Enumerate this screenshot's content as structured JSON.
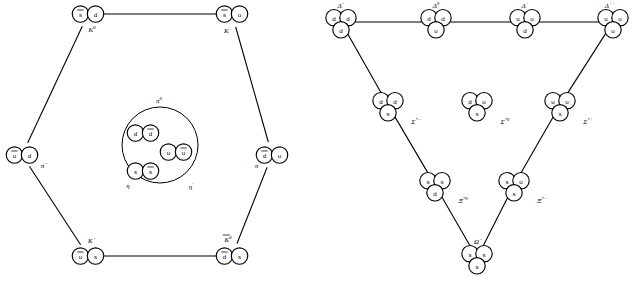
{
  "figure": {
    "title": "",
    "panels": [
      {
        "name": "meson-nonet",
        "shape": "hexagon",
        "nodes": [
          {
            "id": "K0",
            "label": "K",
            "sup": "0",
            "quarks": [
              {
                "f": "s",
                "bar": true
              },
              {
                "f": "d",
                "bar": false
              }
            ],
            "cx": 88,
            "cy": 14,
            "label_x": 92,
            "label_y": 30
          },
          {
            "id": "Kplus",
            "label": "K",
            "sup": "+",
            "quarks": [
              {
                "f": "s",
                "bar": true
              },
              {
                "f": "u",
                "bar": false
              }
            ],
            "cx": 232,
            "cy": 14,
            "label_x": 228,
            "label_y": 31
          },
          {
            "id": "piminus",
            "label": "π",
            "sup": "−",
            "quarks": [
              {
                "f": "u",
                "bar": true
              },
              {
                "f": "d",
                "bar": false
              }
            ],
            "cx": 22,
            "cy": 155,
            "label_x": 44,
            "label_y": 166
          },
          {
            "id": "piplus",
            "label": "π",
            "sup": "+",
            "quarks": [
              {
                "f": "d",
                "bar": true
              },
              {
                "f": "u",
                "bar": false
              }
            ],
            "cx": 272,
            "cy": 155,
            "label_x": 258,
            "label_y": 166
          },
          {
            "id": "Kminus",
            "label": "K",
            "sup": "−",
            "quarks": [
              {
                "f": "u",
                "bar": true
              },
              {
                "f": "s",
                "bar": false
              }
            ],
            "cx": 88,
            "cy": 256,
            "label_x": 92,
            "label_y": 241
          },
          {
            "id": "K0bar",
            "label": "K",
            "sup": "0",
            "bar": true,
            "quarks": [
              {
                "f": "d",
                "bar": true
              },
              {
                "f": "s",
                "bar": false
              }
            ],
            "cx": 232,
            "cy": 256,
            "label_x": 228,
            "label_y": 240
          }
        ],
        "edges": [
          [
            "K0",
            "Kplus"
          ],
          [
            "K0",
            "piminus"
          ],
          [
            "Kplus",
            "piplus"
          ],
          [
            "piminus",
            "Kminus"
          ],
          [
            "piplus",
            "K0bar"
          ],
          [
            "Kminus",
            "K0bar"
          ]
        ],
        "center_circle": {
          "cx": 160,
          "cy": 145,
          "r": 38,
          "labels": [
            {
              "text": "π",
              "sup": "0",
              "x": 159,
              "y": 101
            },
            {
              "text": "η",
              "sup": "",
              "x": 128,
              "y": 186
            },
            {
              "text": "η",
              "sup": "′",
              "x": 191,
              "y": 187
            }
          ],
          "pairs": [
            {
              "quarks": [
                {
                  "f": "d",
                  "bar": false
                },
                {
                  "f": "d",
                  "bar": true
                }
              ],
              "cx": 143,
              "cy": 133
            },
            {
              "quarks": [
                {
                  "f": "u",
                  "bar": false
                },
                {
                  "f": "u",
                  "bar": true
                }
              ],
              "cx": 176,
              "cy": 152
            },
            {
              "quarks": [
                {
                  "f": "s",
                  "bar": false
                },
                {
                  "f": "s",
                  "bar": true
                }
              ],
              "cx": 143,
              "cy": 171
            }
          ]
        }
      },
      {
        "name": "baryon-decuplet",
        "shape": "triangle",
        "nodes": [
          {
            "id": "Dminus",
            "label": "Δ",
            "sup": "−",
            "quarks": [
              {
                "f": "d"
              },
              {
                "f": "d"
              },
              {
                "f": "d"
              }
            ],
            "cx": 341,
            "cy": 22,
            "label_x": 341,
            "label_y": 6
          },
          {
            "id": "D0",
            "label": "Δ",
            "sup": "0",
            "quarks": [
              {
                "f": "d"
              },
              {
                "f": "d"
              },
              {
                "f": "u"
              }
            ],
            "cx": 436,
            "cy": 22,
            "label_x": 436,
            "label_y": 6
          },
          {
            "id": "Dplus",
            "label": "Δ",
            "sup": "+",
            "quarks": [
              {
                "f": "u"
              },
              {
                "f": "u"
              },
              {
                "f": "d"
              }
            ],
            "cx": 525,
            "cy": 22,
            "label_x": 525,
            "label_y": 6
          },
          {
            "id": "Dplusplus",
            "label": "Δ",
            "sup": "++",
            "quarks": [
              {
                "f": "u"
              },
              {
                "f": "u"
              },
              {
                "f": "u"
              }
            ],
            "cx": 613,
            "cy": 22,
            "label_x": 610,
            "label_y": 6
          },
          {
            "id": "Sminus",
            "label": "Σ",
            "sup": "*−",
            "quarks": [
              {
                "f": "d"
              },
              {
                "f": "d"
              },
              {
                "f": "s"
              }
            ],
            "cx": 388,
            "cy": 105,
            "label_x": 416,
            "label_y": 122
          },
          {
            "id": "S0",
            "label": "Σ",
            "sup": "*0",
            "quarks": [
              {
                "f": "d"
              },
              {
                "f": "u"
              },
              {
                "f": "s"
              }
            ],
            "cx": 477,
            "cy": 105,
            "label_x": 505,
            "label_y": 122
          },
          {
            "id": "Splus",
            "label": "Σ",
            "sup": "*+",
            "quarks": [
              {
                "f": "u"
              },
              {
                "f": "u"
              },
              {
                "f": "s"
              }
            ],
            "cx": 560,
            "cy": 105,
            "label_x": 588,
            "label_y": 122
          },
          {
            "id": "Xi0",
            "label": "Ξ",
            "sup": "*0",
            "quarks": [
              {
                "f": "s"
              },
              {
                "f": "s"
              },
              {
                "f": "d"
              }
            ],
            "cx": 435,
            "cy": 185,
            "label_x": 463,
            "label_y": 201
          },
          {
            "id": "Ximinus",
            "label": "Ξ",
            "sup": "*−",
            "quarks": [
              {
                "f": "s"
              },
              {
                "f": "u"
              },
              {
                "f": "s"
              }
            ],
            "cx": 514,
            "cy": 185,
            "label_x": 542,
            "label_y": 201
          },
          {
            "id": "Omega",
            "label": "Ω",
            "sup": "−",
            "quarks": [
              {
                "f": "s"
              },
              {
                "f": "s"
              },
              {
                "f": "s"
              }
            ],
            "cx": 477,
            "cy": 258,
            "label_x": 478,
            "label_y": 242
          }
        ],
        "edges": [
          [
            "Dminus",
            "D0"
          ],
          [
            "D0",
            "Dplus"
          ],
          [
            "Dplus",
            "Dplusplus"
          ],
          [
            "Dminus",
            "Sminus"
          ],
          [
            "Sminus",
            "Xi0"
          ],
          [
            "Xi0",
            "Omega"
          ],
          [
            "Dplusplus",
            "Splus"
          ],
          [
            "Splus",
            "Ximinus"
          ],
          [
            "Ximinus",
            "Omega"
          ]
        ]
      }
    ]
  },
  "quark_flavors": {
    "u": "u",
    "d": "d",
    "s": "s"
  },
  "colors": {
    "stroke": "#000000",
    "fill": "#ffffff",
    "background": "#ffffff"
  }
}
